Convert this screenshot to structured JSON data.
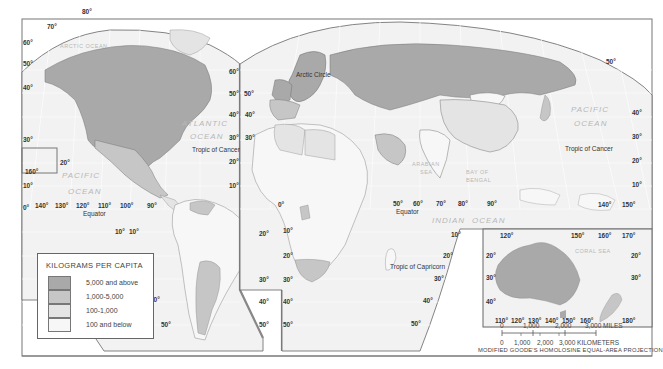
{
  "map": {
    "projection": "MODIFIED GOODE'S HOMOLOSINE EQUAL-AREA PROJECTION",
    "colors": {
      "level_5000_above": "#a9a9a9",
      "level_1000_5000": "#c6c6c6",
      "level_100_1000": "#e4e4e4",
      "level_100_below": "#f7f7f7",
      "ocean": "#f2f2f2",
      "graticule": "#ffffff",
      "border": "#666666"
    },
    "legend": {
      "title": "KILOGRAMS PER CAPITA",
      "items": [
        {
          "label": "5,000 and above",
          "color": "#a9a9a9"
        },
        {
          "label": "1,000-5,000",
          "color": "#c6c6c6"
        },
        {
          "label": "100-1,000",
          "color": "#e4e4e4"
        },
        {
          "label": "100 and below",
          "color": "#f7f7f7"
        }
      ]
    },
    "oceans": {
      "arctic": "ARCTIC OCEAN",
      "atlantic_1": "ATLANTIC",
      "atlantic_2": "OCEAN",
      "pacific_w_1": "PACIFIC",
      "pacific_w_2": "OCEAN",
      "pacific_e_1": "PACIFIC",
      "pacific_e_2": "OCEAN",
      "indian_1": "INDIAN",
      "indian_2": "OCEAN",
      "arabian_1": "ARABIAN",
      "arabian_2": "SEA",
      "bengal_1": "BAY OF",
      "bengal_2": "BENGAL",
      "coral": "CORAL SEA"
    },
    "lines": {
      "arctic_circle": "Arctic Circle",
      "tropic_cancer": "Tropic of Cancer",
      "tropic_capricorn": "Tropic of Capricorn",
      "equator": "Equator"
    },
    "degrees": {
      "d0": "0°",
      "d10": "10°",
      "d20": "20°",
      "d30": "30°",
      "d40": "40°",
      "d50": "50°",
      "d60": "60°",
      "d70": "70°",
      "d80": "80°",
      "d90": "90°",
      "d100": "100°",
      "d110": "110°",
      "d120": "120°",
      "d130": "130°",
      "d140": "140°",
      "d150": "150°",
      "d160": "160°",
      "d170": "170°",
      "d180": "180°"
    },
    "scale": {
      "miles": [
        "0",
        "1,000",
        "2,000",
        "3,000 MILES"
      ],
      "kilometers": [
        "0",
        "1,000",
        "2,000",
        "3,000 KILOMETERS"
      ]
    }
  }
}
